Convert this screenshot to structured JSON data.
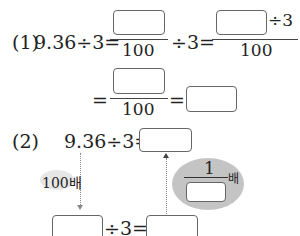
{
  "problem1": {
    "label": "(1)",
    "lhs": "9.36÷3=",
    "denom1": "100",
    "div1": "÷3=",
    "div2": "÷3",
    "denom2": "100",
    "eq1": "=",
    "denom3": "100",
    "eq2": "="
  },
  "problem2": {
    "label": "(2)",
    "lhs": "9.36÷3=",
    "left_label": "100배",
    "fraction_numerator": "1",
    "fraction_suffix": "배",
    "bottom_op": "÷3="
  }
}
